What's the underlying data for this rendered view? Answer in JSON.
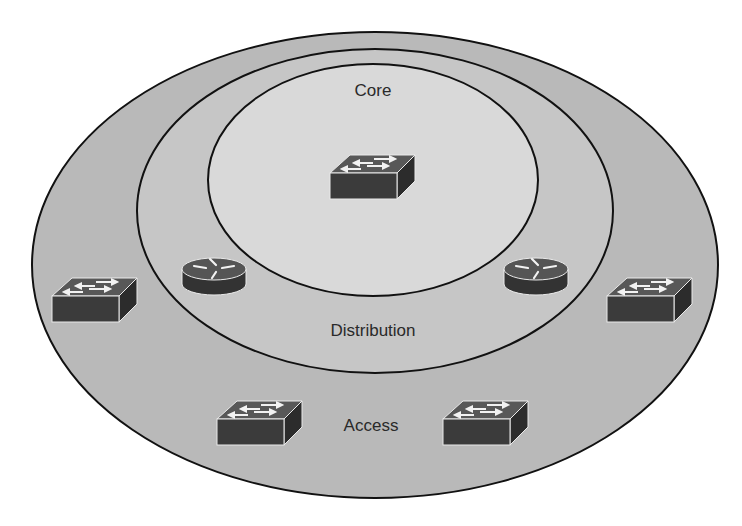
{
  "diagram": {
    "layers": [
      {
        "id": "access",
        "label": "Access",
        "fill": "#b9b9b9",
        "cx": 375,
        "cy": 265,
        "rx": 343,
        "ry": 233,
        "label_x": 371,
        "label_y": 431
      },
      {
        "id": "distribution",
        "label": "Distribution",
        "fill": "#c6c6c6",
        "cx": 375,
        "cy": 211,
        "rx": 238,
        "ry": 162,
        "label_x": 373,
        "label_y": 336
      },
      {
        "id": "core",
        "label": "Core",
        "fill": "#d9d9d9",
        "cx": 373,
        "cy": 180,
        "rx": 165,
        "ry": 116,
        "label_x": 373,
        "label_y": 96
      }
    ],
    "devices": [
      {
        "type": "switch",
        "layer": "core",
        "x": 330,
        "y": 155
      },
      {
        "type": "router",
        "layer": "distribution",
        "x": 182,
        "y": 255
      },
      {
        "type": "router",
        "layer": "distribution",
        "x": 503,
        "y": 255
      },
      {
        "type": "switch",
        "layer": "access",
        "x": 52,
        "y": 278
      },
      {
        "type": "switch",
        "layer": "access",
        "x": 607,
        "y": 278
      },
      {
        "type": "switch",
        "layer": "access",
        "x": 217,
        "y": 400
      },
      {
        "type": "switch",
        "layer": "access",
        "x": 443,
        "y": 400
      }
    ],
    "colors": {
      "stroke": "#111111",
      "device_front": "#3b3b3b",
      "device_top": "#585858",
      "device_side": "#2c2c2c",
      "arrow": "#f2f2f2",
      "text": "#2a2a2a"
    }
  }
}
